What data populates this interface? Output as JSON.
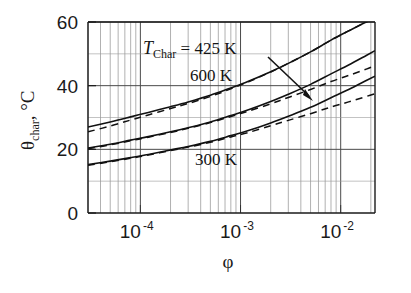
{
  "chart_data": {
    "type": "line",
    "title": "",
    "xlabel": "φ",
    "ylabel": "θchar, °C",
    "ylabel_base": "θ",
    "ylabel_sub": "char",
    "ylabel_unit": ", °C",
    "xscale": "log",
    "yscale": "linear",
    "xlim": [
      3e-05,
      0.022
    ],
    "ylim": [
      0,
      60
    ],
    "xticks": [
      {
        "value": 0.0001,
        "label": "10",
        "exponent": "-4"
      },
      {
        "value": 0.001,
        "label": "10",
        "exponent": "-3"
      },
      {
        "value": 0.01,
        "label": "10",
        "exponent": "-2"
      }
    ],
    "yticks": [
      {
        "value": 0,
        "label": "0"
      },
      {
        "value": 20,
        "label": "20"
      },
      {
        "value": 40,
        "label": "40"
      },
      {
        "value": 60,
        "label": "60"
      }
    ],
    "y_minor_gridlines": [
      10,
      30,
      50
    ],
    "grid": true,
    "grid_minor_log": true,
    "legend_position": "inside-annotations",
    "annotations": [
      {
        "name": "t-char-425",
        "text_italic": "T",
        "text_sub": "Char",
        "text_rest": " = 425 K",
        "x_px": 143,
        "y_px": 54
      },
      {
        "name": "t-char-600",
        "text": "600 K",
        "x_px": 190,
        "y_px": 81
      },
      {
        "name": "t-char-300",
        "text": "300 K",
        "x_px": 195,
        "y_px": 165
      },
      {
        "name": "arrow-to-600-curve",
        "from_px": [
          268,
          57
        ],
        "to_px": [
          313,
          100
        ]
      }
    ],
    "series": [
      {
        "name": "425 K solid",
        "style": "solid",
        "color": "#111111",
        "points": [
          [
            3e-05,
            27.0
          ],
          [
            5e-05,
            28.6
          ],
          [
            8e-05,
            30.2
          ],
          [
            0.00012,
            31.6
          ],
          [
            0.0002,
            33.4
          ],
          [
            0.0003,
            34.9
          ],
          [
            0.0005,
            37.0
          ],
          [
            0.0008,
            39.3
          ],
          [
            0.0012,
            41.4
          ],
          [
            0.002,
            44.4
          ],
          [
            0.003,
            47.0
          ],
          [
            0.005,
            50.6
          ],
          [
            0.008,
            54.3
          ],
          [
            0.012,
            57.2
          ],
          [
            0.018,
            60.0
          ],
          [
            0.022,
            61.0
          ]
        ]
      },
      {
        "name": "425 K dashed",
        "style": "dashed",
        "color": "#111111",
        "points": [
          [
            3e-05,
            25.5
          ],
          [
            5e-05,
            27.3
          ],
          [
            8e-05,
            29.2
          ],
          [
            0.00012,
            30.8
          ],
          [
            0.0002,
            32.8
          ],
          [
            0.0003,
            34.4
          ],
          [
            0.0005,
            36.6
          ],
          [
            0.0008,
            39.0
          ],
          [
            0.0012,
            41.2
          ],
          [
            0.002,
            44.3
          ],
          [
            0.003,
            47.0
          ],
          [
            0.005,
            50.6
          ],
          [
            0.008,
            54.3
          ],
          [
            0.012,
            57.2
          ],
          [
            0.018,
            60.0
          ],
          [
            0.022,
            61.0
          ]
        ]
      },
      {
        "name": "600 K solid",
        "style": "solid",
        "color": "#111111",
        "points": [
          [
            3e-05,
            20.4
          ],
          [
            5e-05,
            21.6
          ],
          [
            8e-05,
            22.9
          ],
          [
            0.00012,
            24.0
          ],
          [
            0.0002,
            25.5
          ],
          [
            0.0003,
            26.8
          ],
          [
            0.0005,
            28.6
          ],
          [
            0.0008,
            30.6
          ],
          [
            0.0012,
            32.4
          ],
          [
            0.002,
            35.0
          ],
          [
            0.003,
            37.3
          ],
          [
            0.005,
            40.4
          ],
          [
            0.008,
            43.7
          ],
          [
            0.012,
            46.5
          ],
          [
            0.018,
            49.5
          ],
          [
            0.022,
            51.0
          ]
        ]
      },
      {
        "name": "600 K dashed",
        "style": "dashed",
        "color": "#111111",
        "points": [
          [
            3e-05,
            20.2
          ],
          [
            5e-05,
            21.4
          ],
          [
            8e-05,
            22.7
          ],
          [
            0.00012,
            23.8
          ],
          [
            0.0002,
            25.3
          ],
          [
            0.0003,
            26.6
          ],
          [
            0.0005,
            28.4
          ],
          [
            0.0008,
            30.3
          ],
          [
            0.0012,
            32.0
          ],
          [
            0.002,
            34.3
          ],
          [
            0.003,
            36.3
          ],
          [
            0.005,
            38.8
          ],
          [
            0.008,
            41.3
          ],
          [
            0.012,
            43.2
          ],
          [
            0.018,
            45.2
          ],
          [
            0.022,
            46.3
          ]
        ]
      },
      {
        "name": "300 K solid",
        "style": "solid",
        "color": "#111111",
        "points": [
          [
            3e-05,
            15.2
          ],
          [
            5e-05,
            16.3
          ],
          [
            8e-05,
            17.4
          ],
          [
            0.00012,
            18.4
          ],
          [
            0.0002,
            19.8
          ],
          [
            0.0003,
            20.9
          ],
          [
            0.0005,
            22.5
          ],
          [
            0.0008,
            24.3
          ],
          [
            0.0012,
            25.9
          ],
          [
            0.002,
            28.3
          ],
          [
            0.003,
            30.4
          ],
          [
            0.005,
            33.2
          ],
          [
            0.008,
            36.2
          ],
          [
            0.012,
            38.8
          ],
          [
            0.018,
            41.6
          ],
          [
            0.022,
            43.0
          ]
        ]
      },
      {
        "name": "300 K dashed",
        "style": "dashed",
        "color": "#111111",
        "points": [
          [
            3e-05,
            15.0
          ],
          [
            5e-05,
            16.1
          ],
          [
            8e-05,
            17.2
          ],
          [
            0.00012,
            18.2
          ],
          [
            0.0002,
            19.6
          ],
          [
            0.0003,
            20.7
          ],
          [
            0.0005,
            22.2
          ],
          [
            0.0008,
            23.9
          ],
          [
            0.0012,
            25.3
          ],
          [
            0.002,
            27.4
          ],
          [
            0.003,
            29.1
          ],
          [
            0.005,
            31.2
          ],
          [
            0.008,
            33.3
          ],
          [
            0.012,
            34.9
          ],
          [
            0.018,
            36.6
          ],
          [
            0.022,
            37.5
          ]
        ]
      }
    ]
  }
}
